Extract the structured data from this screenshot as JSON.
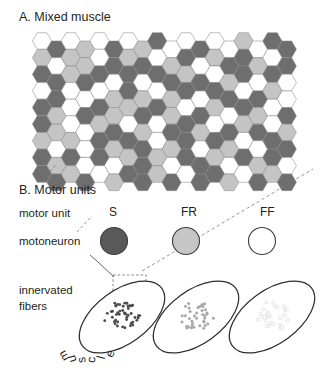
{
  "figure": {
    "panel_a": {
      "title": "A. Mixed muscle"
    },
    "panel_b": {
      "title": "B. Motor units",
      "row_labels": [
        {
          "name": "motor-unit",
          "text": "motor unit"
        },
        {
          "name": "motoneuron",
          "text": "motoneuron"
        },
        {
          "name": "innervated-fibers-line1",
          "text": "innervated"
        },
        {
          "name": "innervated-fibers-line2",
          "text": "fibers"
        }
      ],
      "muscle_label": "muscle",
      "unit_types": [
        {
          "id": "S",
          "label": "S",
          "soma_fill": "#595959",
          "dot_fill": "#4d4d4d",
          "dot_count": 46,
          "dot_radius": 1.45
        },
        {
          "id": "FR",
          "label": "FR",
          "soma_fill": "#c6c6c6",
          "dot_fill": "#a8a8a8",
          "dot_count": 40,
          "dot_radius": 1.5
        },
        {
          "id": "FF",
          "label": "FF",
          "soma_fill": "#ffffff",
          "dot_fill": "#dcdcdc",
          "dot_count": 28,
          "dot_radius": 1.6
        }
      ]
    },
    "colors": {
      "shade_white": "#ffffff",
      "shade_light": "#c4c4c4",
      "shade_dark": "#6e6e6e",
      "stroke": "#8c8c8c",
      "ink": "#231f20"
    },
    "hex_grid": {
      "columns": 18,
      "rows": 9,
      "shade_legend": {
        "0": "white",
        "1": "light-gray",
        "2": "dark-gray"
      },
      "cells": [
        [
          0,
          2,
          0,
          1,
          0,
          2,
          0,
          1,
          2,
          0,
          0,
          2,
          0,
          0,
          1,
          0,
          2,
          2
        ],
        [
          1,
          0,
          1,
          1,
          0,
          2,
          1,
          2,
          0,
          1,
          2,
          0,
          1,
          2,
          2,
          1,
          0,
          2
        ],
        [
          2,
          2,
          1,
          2,
          2,
          0,
          2,
          0,
          2,
          2,
          1,
          2,
          0,
          1,
          2,
          0,
          2,
          0
        ],
        [
          0,
          2,
          0,
          0,
          0,
          1,
          2,
          1,
          0,
          1,
          2,
          0,
          2,
          2,
          0,
          2,
          1,
          0
        ],
        [
          2,
          1,
          0,
          2,
          2,
          1,
          1,
          2,
          2,
          1,
          0,
          2,
          1,
          0,
          2,
          1,
          0,
          2
        ],
        [
          2,
          1,
          0,
          0,
          1,
          2,
          0,
          1,
          0,
          2,
          2,
          1,
          0,
          2,
          1,
          2,
          0,
          1
        ],
        [
          1,
          0,
          1,
          0,
          2,
          1,
          2,
          2,
          0,
          1,
          2,
          0,
          2,
          1,
          0,
          0,
          2,
          2
        ],
        [
          2,
          1,
          2,
          0,
          2,
          0,
          1,
          2,
          1,
          0,
          2,
          2,
          1,
          0,
          2,
          1,
          2,
          0
        ],
        [
          2,
          2,
          1,
          2,
          0,
          1,
          2,
          2,
          1,
          2,
          0,
          2,
          2,
          1,
          0,
          2,
          1,
          2
        ]
      ]
    }
  }
}
